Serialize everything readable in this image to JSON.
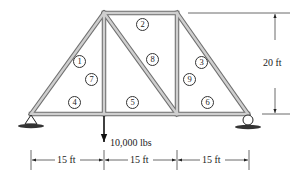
{
  "diagram": {
    "type": "truss",
    "load": {
      "label": "10,000 lbs",
      "direction": "down"
    },
    "height_dimension": {
      "label": "20 ft"
    },
    "span_dimensions": [
      {
        "label": "15 ft"
      },
      {
        "label": "15 ft"
      },
      {
        "label": "15 ft"
      }
    ],
    "members": [
      {
        "id": "1",
        "x": 73,
        "y": 61
      },
      {
        "id": "2",
        "x": 142,
        "y": 18
      },
      {
        "id": "3",
        "x": 199,
        "y": 59
      },
      {
        "id": "4",
        "x": 68,
        "y": 97
      },
      {
        "id": "5",
        "x": 133,
        "y": 97
      },
      {
        "id": "6",
        "x": 201,
        "y": 97
      },
      {
        "id": "7",
        "x": 84,
        "y": 73
      },
      {
        "id": "8",
        "x": 146,
        "y": 53
      },
      {
        "id": "9",
        "x": 184,
        "y": 73
      }
    ],
    "supports": [
      {
        "type": "pin",
        "position": "left"
      },
      {
        "type": "roller",
        "position": "right"
      }
    ],
    "colors": {
      "member_fill": "#c8c8c8",
      "member_edge": "#6e6e6e",
      "line": "#333333"
    }
  }
}
